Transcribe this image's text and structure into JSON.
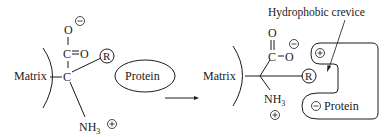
{
  "figure": {
    "left": {
      "matrix_label": "Matrix",
      "carbon": "C",
      "carboxyl_carbon": "C",
      "oxygen_double": "O",
      "oxygen_single": "O",
      "amine": "NH",
      "amine_subscript": "3",
      "r_group": "R",
      "minus_sign": "−",
      "plus_sign": "+",
      "protein_label": "Protein"
    },
    "arrow": "reaction-arrow",
    "right": {
      "matrix_label": "Matrix",
      "carboxyl_carbon": "C",
      "oxygen_double": "O",
      "oxygen_single": "O",
      "amine": "NH",
      "amine_subscript": "3",
      "r_group": "R",
      "minus_sign": "−",
      "plus_sign": "+",
      "protein_label": "Protein",
      "protein_charge_minus": "−",
      "protein_charge_plus": "+",
      "annotation": "Hydrophobic crevice"
    }
  }
}
